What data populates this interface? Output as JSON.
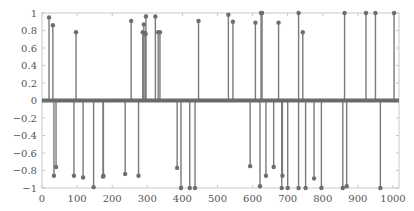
{
  "chart_data": {
    "type": "stem",
    "title": "",
    "xlabel": "",
    "ylabel": "",
    "xlim": [
      0,
      1020
    ],
    "ylim": [
      -1,
      1
    ],
    "grid": false,
    "legend": null,
    "xticks": [
      0,
      100,
      200,
      300,
      400,
      500,
      600,
      700,
      800,
      900,
      1000
    ],
    "yticks": [
      1,
      0.8,
      0.6,
      0.4,
      0.2,
      0,
      -0.2,
      -0.4,
      -0.6,
      -0.8,
      -1
    ],
    "ytick_labels": [
      "1",
      "0.8",
      "0.6",
      "0.4",
      "0.2",
      "0",
      "−0.2",
      "−0.4",
      "−0.6",
      "−0.8",
      "−1"
    ],
    "colors": {
      "stem": "#7a7a7a",
      "marker": "#6e6e6e",
      "baseline": "#6a6a6a",
      "axis": "#c8c8c8",
      "tick_text": "#555555"
    },
    "series": [
      {
        "name": "signal",
        "x": [
          20,
          31,
          34,
          40,
          91,
          97,
          117,
          147,
          174,
          175,
          237,
          254,
          275,
          287,
          290,
          294,
          295,
          296,
          323,
          331,
          336,
          385,
          396,
          421,
          436,
          446,
          531,
          544,
          593,
          608,
          621,
          624,
          627,
          638,
          660,
          674,
          683,
          685,
          700,
          731,
          731,
          743,
          751,
          775,
          796,
          857,
          862,
          868,
          923,
          950,
          964,
          1003
        ],
        "y": [
          0.95,
          0.86,
          -0.86,
          -0.76,
          -0.86,
          0.78,
          -0.88,
          -0.99,
          -0.87,
          -0.86,
          -0.84,
          0.91,
          -0.86,
          0.78,
          0.87,
          0.77,
          0.76,
          0.96,
          0.96,
          0.78,
          0.78,
          -0.77,
          -1.0,
          -1.0,
          -1.0,
          0.91,
          0.98,
          0.9,
          -0.75,
          0.89,
          -0.98,
          1.0,
          1.0,
          -0.86,
          -0.76,
          0.89,
          -1.0,
          -0.86,
          -1.0,
          1.0,
          -1.0,
          0.78,
          -1.0,
          -0.89,
          -1.0,
          -1.0,
          1.0,
          -0.98,
          1.0,
          1.0,
          -1.0,
          1.0
        ]
      }
    ]
  }
}
